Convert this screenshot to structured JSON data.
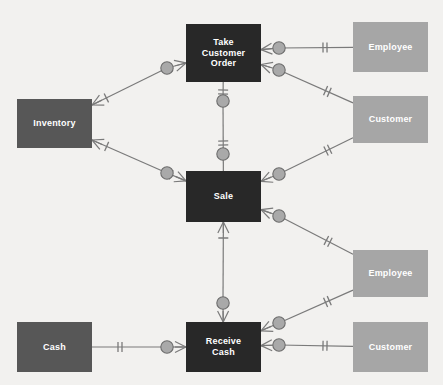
{
  "diagram": {
    "background_color": "#f2f1ef",
    "palette": {
      "event_box": "#282828",
      "resource_box": "#575757",
      "agent_box": "#a6a6a6",
      "connector_fill": "#a9a9a9",
      "connector_stroke": "#6d6d6d",
      "line_color": "#7a7a7a",
      "label_color": "#ffffff"
    },
    "entities": [
      {
        "id": "take_customer_order",
        "label": "Take\nCustomer Order",
        "kind": "event",
        "x": 186,
        "y": 24,
        "w": 75,
        "h": 58
      },
      {
        "id": "employee_top",
        "label": "Employee",
        "kind": "agent",
        "x": 353,
        "y": 22,
        "w": 75,
        "h": 50
      },
      {
        "id": "inventory",
        "label": "Inventory",
        "kind": "resource",
        "x": 17,
        "y": 99,
        "w": 75,
        "h": 49
      },
      {
        "id": "customer_top",
        "label": "Customer",
        "kind": "agent",
        "x": 353,
        "y": 96,
        "w": 75,
        "h": 47
      },
      {
        "id": "sale",
        "label": "Sale",
        "kind": "event",
        "x": 186,
        "y": 171,
        "w": 75,
        "h": 51
      },
      {
        "id": "employee_bottom",
        "label": "Employee",
        "kind": "agent",
        "x": 353,
        "y": 250,
        "w": 75,
        "h": 47
      },
      {
        "id": "cash",
        "label": "Cash",
        "kind": "resource",
        "x": 17,
        "y": 322,
        "w": 75,
        "h": 50
      },
      {
        "id": "receive_cash",
        "label": "Receive\nCash",
        "kind": "event",
        "x": 186,
        "y": 322,
        "w": 75,
        "h": 50
      },
      {
        "id": "customer_bottom",
        "label": "Customer",
        "kind": "agent",
        "x": 353,
        "y": 322,
        "w": 75,
        "h": 50
      }
    ],
    "relationship_nodes": [
      {
        "id": "r_inv_order",
        "x": 167,
        "y": 68
      },
      {
        "id": "r_order_emp",
        "x": 279,
        "y": 48
      },
      {
        "id": "r_order_cust",
        "x": 279,
        "y": 70
      },
      {
        "id": "r_order_duality",
        "x": 223,
        "y": 101
      },
      {
        "id": "r_sale_duality",
        "x": 223,
        "y": 154
      },
      {
        "id": "r_inv_sale",
        "x": 167,
        "y": 173
      },
      {
        "id": "r_sale_cust",
        "x": 279,
        "y": 174
      },
      {
        "id": "r_sale_emp",
        "x": 279,
        "y": 216
      },
      {
        "id": "r_sale_cash",
        "x": 223,
        "y": 303
      },
      {
        "id": "r_cash_receive",
        "x": 167,
        "y": 347
      },
      {
        "id": "r_recv_emp",
        "x": 279,
        "y": 323
      },
      {
        "id": "r_recv_cust",
        "x": 279,
        "y": 345
      }
    ],
    "relationships": [
      {
        "id": "rel_inventory_order",
        "from": "inventory",
        "to": "take_customer_order",
        "via": "r_inv_order",
        "from_cardinality": "many",
        "to_cardinality": "many"
      },
      {
        "id": "rel_order_employee",
        "from": "take_customer_order",
        "to": "employee_top",
        "via": "r_order_emp",
        "from_cardinality": "many",
        "to_cardinality": "one"
      },
      {
        "id": "rel_order_customer",
        "from": "take_customer_order",
        "to": "customer_top",
        "via": "r_order_cust",
        "from_cardinality": "many",
        "to_cardinality": "one"
      },
      {
        "id": "rel_order_sale",
        "from": "take_customer_order",
        "to": "sale",
        "via": "r_order_duality",
        "from_cardinality": "one",
        "to_cardinality": "one"
      },
      {
        "id": "rel_inventory_sale",
        "from": "inventory",
        "to": "sale",
        "via": "r_inv_sale",
        "from_cardinality": "many",
        "to_cardinality": "many"
      },
      {
        "id": "rel_sale_customer",
        "from": "sale",
        "to": "customer_top",
        "via": "r_sale_cust",
        "from_cardinality": "many",
        "to_cardinality": "one"
      },
      {
        "id": "rel_sale_employee",
        "from": "sale",
        "to": "employee_bottom",
        "via": "r_sale_emp",
        "from_cardinality": "many",
        "to_cardinality": "one"
      },
      {
        "id": "rel_sale_receivecash",
        "from": "sale",
        "to": "receive_cash",
        "via": "r_sale_cash",
        "from_cardinality": "many",
        "to_cardinality": "many"
      },
      {
        "id": "rel_cash_receivecash",
        "from": "cash",
        "to": "receive_cash",
        "via": "r_cash_receive",
        "from_cardinality": "one",
        "to_cardinality": "many"
      },
      {
        "id": "rel_recv_employee",
        "from": "receive_cash",
        "to": "employee_bottom",
        "via": "r_recv_emp",
        "from_cardinality": "many",
        "to_cardinality": "one"
      },
      {
        "id": "rel_recv_customer",
        "from": "receive_cash",
        "to": "customer_bottom",
        "via": "r_recv_cust",
        "from_cardinality": "many",
        "to_cardinality": "one"
      }
    ]
  }
}
